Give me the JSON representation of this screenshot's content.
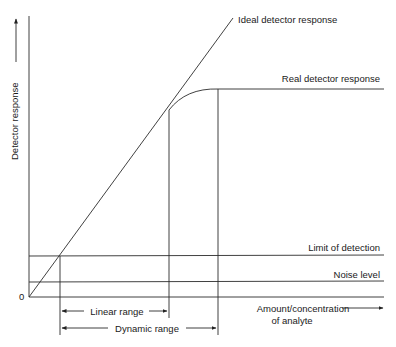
{
  "diagram": {
    "y_axis_label": "Detector response",
    "x_axis_label_line1": "Amount/concentration",
    "x_axis_label_line2": "of analyte",
    "origin_label": "0",
    "curves": {
      "ideal": "Ideal detector response",
      "real": "Real detector response"
    },
    "levels": {
      "lod": "Limit of detection",
      "noise": "Noise level"
    },
    "ranges": {
      "linear": "Linear range",
      "dynamic": "Dynamic range"
    }
  }
}
